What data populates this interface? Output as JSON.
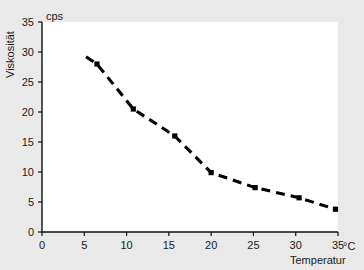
{
  "chart_data": {
    "type": "line",
    "title": "",
    "subtitle": "",
    "xlabel": "Temperatur",
    "ylabel": "Viskosität",
    "x_unit": "°C",
    "y_unit": "cps",
    "xlim": [
      0,
      35
    ],
    "ylim": [
      0,
      35
    ],
    "xticks": [
      0,
      5,
      10,
      15,
      20,
      25,
      30,
      35
    ],
    "yticks": [
      0,
      5,
      10,
      15,
      20,
      25,
      30,
      35
    ],
    "xtick_labels": [
      "0",
      "5",
      "10",
      "15",
      "20",
      "25",
      "30",
      "35"
    ],
    "ytick_labels": [
      "0",
      "5",
      "10",
      "15",
      "20",
      "25",
      "30",
      "35"
    ],
    "grid": false,
    "legend": false,
    "legend_position": "none",
    "line_style": "dashed",
    "marker": "square",
    "series": [
      {
        "name": "Viskosität",
        "color": "#000000",
        "x": [
          6.5,
          10.8,
          15.7,
          20.0,
          25.2,
          30.4,
          34.7
        ],
        "values": [
          28.0,
          20.5,
          16.0,
          9.9,
          7.4,
          5.7,
          3.8
        ]
      }
    ],
    "line_path_x": [
      5.2,
      6.5,
      10.8,
      15.7,
      20.0,
      25.2,
      30.4,
      34.7
    ],
    "line_path_y": [
      29.2,
      28.0,
      20.5,
      16.0,
      9.9,
      7.4,
      5.7,
      3.8
    ]
  },
  "axes": {
    "y_unit_label": "cps",
    "x_unit_label": "°C",
    "x_title": "Temperatur",
    "y_title": "Viskosität"
  },
  "colors": {
    "background": "#e9e9e9",
    "plot_background": "#ffffff",
    "axis": "#111111",
    "data": "#000000",
    "text": "#1a1a1a"
  }
}
